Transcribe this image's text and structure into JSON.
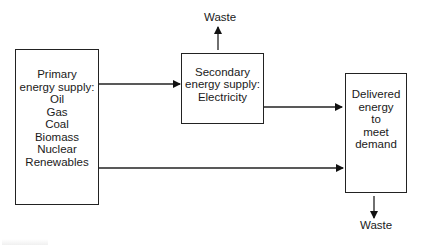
{
  "diagram": {
    "type": "flow",
    "nodes": {
      "primary": {
        "title_lines": [
          "Primary",
          "energy supply:"
        ],
        "items": [
          "Oil",
          "Gas",
          "Coal",
          "Biomass",
          "Nuclear",
          "Renewables"
        ]
      },
      "secondary": {
        "lines": [
          "Secondary",
          "energy supply:",
          "Electricity"
        ]
      },
      "delivered": {
        "lines": [
          "Delivered",
          "energy",
          "to",
          "meet",
          "demand"
        ]
      }
    },
    "waste_top": "Waste",
    "waste_bottom": "Waste",
    "edges": [
      {
        "from": "primary",
        "to": "secondary"
      },
      {
        "from": "secondary",
        "to": "delivered"
      },
      {
        "from": "primary",
        "to": "delivered"
      },
      {
        "from": "secondary",
        "to": "waste_top"
      },
      {
        "from": "delivered",
        "to": "waste_bottom"
      }
    ]
  }
}
